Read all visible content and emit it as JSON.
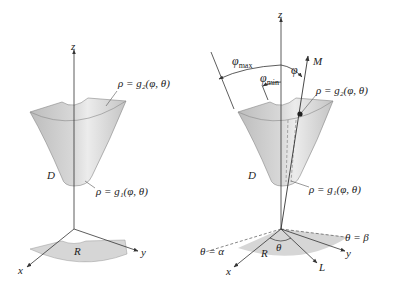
{
  "figure_left": {
    "axis_z": "z",
    "axis_x": "x",
    "axis_y": "y",
    "outer_surface_label": "ρ = g₂(φ, θ)",
    "inner_surface_label": "ρ = g₁(φ, θ)",
    "solid_label": "D",
    "region_label": "R"
  },
  "figure_right": {
    "axis_z": "z",
    "axis_x": "x",
    "axis_y": "y",
    "phi_max_label": "φ",
    "phi_max_sub": "max",
    "phi_min_label": "φ",
    "phi_min_sub": "min",
    "phi_label": "φ",
    "ray_label": "M",
    "outer_surface_label": "ρ = g₂(φ, θ)",
    "inner_surface_label": "ρ = g₁(φ, θ)",
    "solid_label": "D",
    "region_label": "R",
    "theta_label": "θ",
    "theta_alpha_label": "θ = α",
    "theta_beta_label": "θ = β",
    "ray_L_label": "L"
  },
  "colors": {
    "surface": "#c9c9c9",
    "surface_light": "#e4e4e4",
    "region": "#d6d6d6",
    "line": "#333333"
  }
}
